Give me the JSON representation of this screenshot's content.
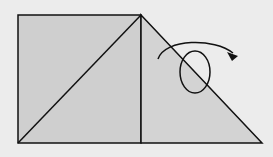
{
  "diagram": {
    "colors": {
      "background": "#ececec",
      "paper_fill": "#cfcfcf",
      "stroke": "#111111"
    },
    "shapes": {
      "square": {
        "x": 18,
        "y": 15,
        "width": 123,
        "height": 128
      },
      "diagonal_crease": {
        "x1": 18,
        "y1": 143,
        "x2": 141,
        "y2": 15
      },
      "triangle_flap": {
        "points": "141,15 262,143 141,143"
      },
      "fold_arrow": {
        "path": "M158,59 C165,38 215,38 237,55",
        "loop": {
          "cx": 195,
          "cy": 72,
          "rx": 15,
          "ry": 21
        },
        "arrowhead": "237,55 228,52 232,60"
      }
    }
  }
}
